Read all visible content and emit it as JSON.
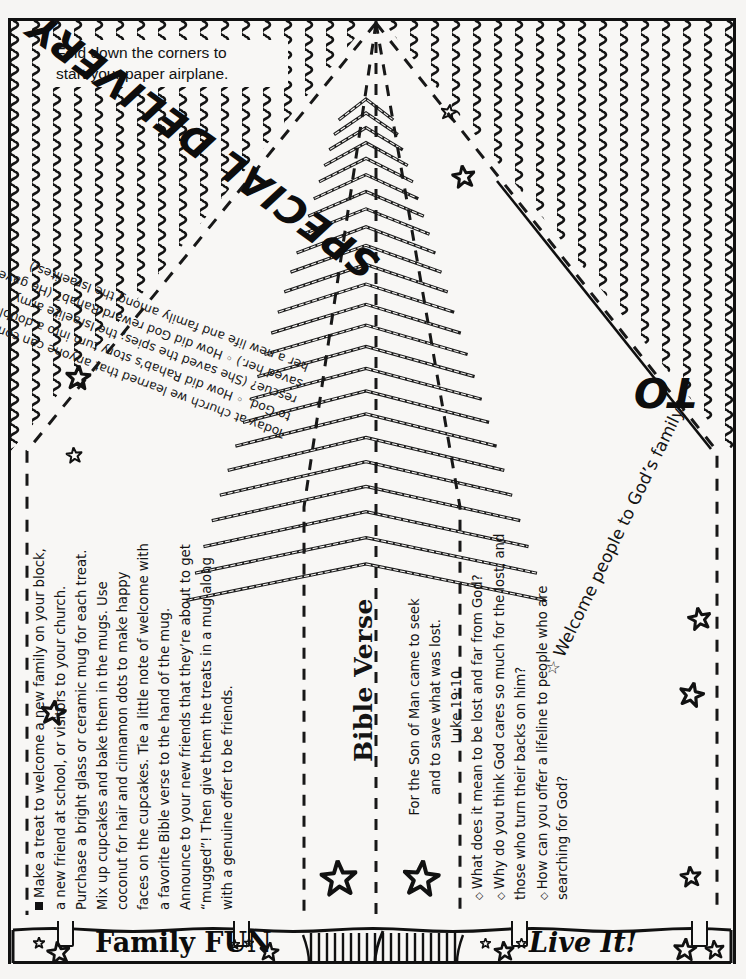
{
  "page": {
    "paper_color": "#f8f7f5",
    "ink_color": "#111111"
  },
  "instruction": {
    "line1": "Fold down the corners to",
    "line2": "start your paper airplane."
  },
  "headline": {
    "special_delivery": "SPECIAL DELIVERY",
    "to": "TO"
  },
  "story": {
    "lead": "Today at church we learned that anyone can come to God.",
    "questions": [
      "How did a double rescue? (She saved the spies; the Israelite army saved her.)",
      "How did God reward Rahab's story turn into a Rahab's and family among the Israelites"
    ],
    "full_text": "Today at church we learned that anyone can come to God. ◦ How did Rahab's story turn into a double rescue? (She saved the spies; the Israelite army saved her.) ◦ How did God reward Rahab? (He gave her a new life and family among the Israelites.)"
  },
  "family_fun": {
    "label": "Family FUN",
    "body": "Make a treat to welcome a new family on your block, a new friend at school, or visitors to your church. Purchase a bright glass or ceramic mug for each treat. Mix up cupcakes and bake them in the mugs. Use coconut for hair and cinnamon dots to make happy faces on the cupcakes. Tie a little note of welcome with a favorite Bible verse to the hand of the mug. Announce to your new friends that they’re about to get “mugged”! Then give them the treats in a mug along with a genuine offer to be friends."
  },
  "bible_verse": {
    "heading": "Bible Verse",
    "text_line1": "For the Son of Man came to seek",
    "text_line2": "and to save what was lost.",
    "reference": "Luke 19:10"
  },
  "live_it": {
    "label": "Live It!",
    "questions": [
      "What does it mean to be lost and far from God?",
      "Why do you think God cares so much for the lost, and those who turn their backs on him?",
      "How can you offer a lifeline to people who are searching for God?"
    ]
  },
  "welcome": {
    "text": "☆ Welcome people to God’s family."
  },
  "decor": {
    "star_icon": "five-point-star",
    "clip_icon": "paper-clip",
    "chevron_icon": "chevron-stack",
    "squiggle_icon": "zigzag-shading"
  }
}
